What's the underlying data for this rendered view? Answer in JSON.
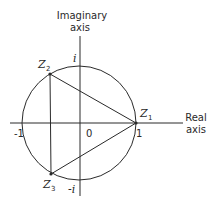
{
  "diagram": {
    "axes": {
      "imaginary_label_line1": "Imaginary",
      "imaginary_label_line2": "axis",
      "real_label_line1": "Real",
      "real_label_line2": "axis"
    },
    "ticks": {
      "origin": "0",
      "pos_real": "1",
      "neg_real": "-1",
      "pos_imag": "i",
      "neg_imag": "-i"
    },
    "points": [
      {
        "name": "Z",
        "sub": "1"
      },
      {
        "name": "Z",
        "sub": "2"
      },
      {
        "name": "Z",
        "sub": "3"
      }
    ],
    "stroke_color": "#2a2a2a",
    "background": "#ffffff"
  }
}
